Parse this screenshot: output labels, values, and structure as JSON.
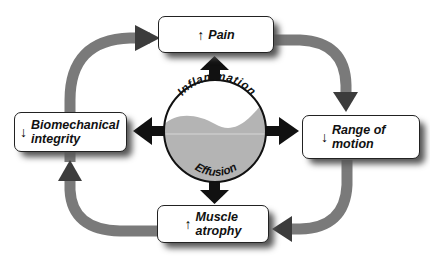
{
  "diagram": {
    "center": {
      "top_label": "Inflammation",
      "bottom_label": "Effusion"
    },
    "nodes": [
      {
        "id": "pain",
        "direction": "up",
        "arrow": "↑",
        "label_lines": [
          "Pain"
        ]
      },
      {
        "id": "range-of-motion",
        "direction": "down",
        "arrow": "↓",
        "label_lines": [
          "Range of",
          "motion"
        ]
      },
      {
        "id": "muscle-atrophy",
        "direction": "up",
        "arrow": "↑",
        "label_lines": [
          "Muscle",
          "atrophy"
        ]
      },
      {
        "id": "biomechanical-integrity",
        "direction": "down",
        "arrow": "↓",
        "label_lines": [
          "Biomechanical",
          "integrity"
        ]
      }
    ],
    "cycle_order": [
      "pain",
      "range-of-motion",
      "muscle-atrophy",
      "biomechanical-integrity",
      "pain"
    ],
    "colors": {
      "cycle_arrow": "#7a7a7a",
      "cycle_arrowhead": "#3c3c3c",
      "center_arrow": "#111111",
      "fluid": "#b4b4b4",
      "box_border": "#222222"
    }
  }
}
